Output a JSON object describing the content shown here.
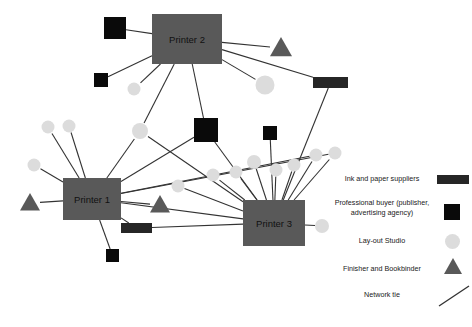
{
  "figure": {
    "type": "network-diagram",
    "title": "",
    "background_color": "#ffffff",
    "width": 472,
    "height": 327
  },
  "colors": {
    "printer_fill": "#595959",
    "printer_text": "#111111",
    "supplier_rect": "#262626",
    "buyer_square": "#0a0a0a",
    "layout_circle": "#dcdcdc",
    "finisher_triangle": "#595959",
    "tie_line": "#333333"
  },
  "legend": {
    "items": [
      {
        "label": "Ink and paper suppliers",
        "icon": "rect-swatch-icon",
        "shape": "rect",
        "color": "#262626"
      },
      {
        "label": "Professional buyer\n(publisher, advertising\nagency)",
        "icon": "square-swatch-icon",
        "shape": "square",
        "color": "#0a0a0a"
      },
      {
        "label": "Lay-out Studio",
        "icon": "circle-swatch-icon",
        "shape": "circle",
        "color": "#dcdcdc"
      },
      {
        "label": "Finisher and Bookbinder",
        "icon": "triangle-swatch-icon",
        "shape": "triangle",
        "color": "#595959"
      },
      {
        "label": "Network tie",
        "icon": "line-swatch-icon",
        "shape": "line",
        "color": "#333333"
      }
    ]
  },
  "nodes": {
    "printers": [
      {
        "id": "p1",
        "label": "Printer 1",
        "x": 63,
        "y": 178,
        "w": 58,
        "h": 42
      },
      {
        "id": "p2",
        "label": "Printer 2",
        "x": 152,
        "y": 14,
        "w": 70,
        "h": 50
      },
      {
        "id": "p3",
        "label": "Printer 3",
        "x": 243,
        "y": 200,
        "w": 62,
        "h": 46
      }
    ],
    "suppliers": [
      {
        "id": "s1",
        "x": 313,
        "y": 77,
        "w": 35,
        "h": 11
      },
      {
        "id": "s2",
        "x": 121,
        "y": 223,
        "w": 31,
        "h": 10
      }
    ],
    "buyers": [
      {
        "id": "b1",
        "x": 104,
        "y": 17,
        "s": 22
      },
      {
        "id": "b2",
        "x": 94,
        "y": 73,
        "s": 14
      },
      {
        "id": "b3",
        "x": 194,
        "y": 118,
        "s": 24
      },
      {
        "id": "b4",
        "x": 263,
        "y": 126,
        "s": 14
      },
      {
        "id": "b5",
        "x": 106,
        "y": 249,
        "s": 13
      }
    ],
    "studios": [
      {
        "id": "c1",
        "cx": 134,
        "cy": 89,
        "r": 6.5
      },
      {
        "id": "c2",
        "cx": 265,
        "cy": 85,
        "r": 9.5
      },
      {
        "id": "c3",
        "cx": 48,
        "cy": 127,
        "r": 6.5
      },
      {
        "id": "c4",
        "cx": 69,
        "cy": 126,
        "r": 6.5
      },
      {
        "id": "c5",
        "cx": 34,
        "cy": 165,
        "r": 6.5
      },
      {
        "id": "c6",
        "cx": 140,
        "cy": 131,
        "r": 8.0
      },
      {
        "id": "c7",
        "cx": 178,
        "cy": 186,
        "r": 6.5
      },
      {
        "id": "c8",
        "cx": 213,
        "cy": 175,
        "r": 6.5
      },
      {
        "id": "c9",
        "cx": 236,
        "cy": 172,
        "r": 6.5
      },
      {
        "id": "c10",
        "cx": 254,
        "cy": 162,
        "r": 7.0
      },
      {
        "id": "c11",
        "cx": 276,
        "cy": 170,
        "r": 6.5
      },
      {
        "id": "c12",
        "cx": 294,
        "cy": 165,
        "r": 6.5
      },
      {
        "id": "c13",
        "cx": 316,
        "cy": 155,
        "r": 6.5
      },
      {
        "id": "c14",
        "cx": 335,
        "cy": 153,
        "r": 6.5
      },
      {
        "id": "c15",
        "cx": 322,
        "cy": 226,
        "r": 7.0
      }
    ],
    "finishers": [
      {
        "id": "f1",
        "cx": 281,
        "cy": 48,
        "size": 11
      },
      {
        "id": "f2",
        "cx": 30,
        "cy": 203,
        "size": 10
      },
      {
        "id": "f3",
        "cx": 160,
        "cy": 205,
        "size": 10
      }
    ]
  },
  "edges": [
    {
      "from": "b1",
      "to": "p2"
    },
    {
      "from": "b2",
      "to": "p2"
    },
    {
      "from": "c1",
      "to": "p2"
    },
    {
      "from": "f1",
      "to": "p2"
    },
    {
      "from": "c2",
      "to": "p2"
    },
    {
      "from": "s1",
      "to": "p2"
    },
    {
      "from": "p2",
      "to": "b3"
    },
    {
      "from": "p2",
      "to": "c6"
    },
    {
      "from": "s1",
      "to": "p3"
    },
    {
      "from": "b4",
      "to": "p3"
    },
    {
      "from": "b3",
      "to": "p1"
    },
    {
      "from": "b3",
      "to": "p3"
    },
    {
      "from": "c6",
      "to": "p1"
    },
    {
      "from": "c6",
      "to": "p3"
    },
    {
      "from": "c3",
      "to": "p1"
    },
    {
      "from": "c4",
      "to": "p1"
    },
    {
      "from": "c5",
      "to": "p1"
    },
    {
      "from": "f2",
      "to": "p1"
    },
    {
      "from": "p1",
      "to": "s2"
    },
    {
      "from": "p1",
      "to": "b5"
    },
    {
      "from": "p1",
      "to": "f3"
    },
    {
      "from": "p1",
      "to": "p3"
    },
    {
      "from": "p1",
      "to": "c13"
    },
    {
      "from": "p1",
      "to": "c14"
    },
    {
      "from": "s2",
      "to": "p3"
    },
    {
      "from": "c7",
      "to": "p3"
    },
    {
      "from": "c8",
      "to": "p3"
    },
    {
      "from": "c9",
      "to": "p3"
    },
    {
      "from": "c10",
      "to": "p3"
    },
    {
      "from": "c11",
      "to": "p3"
    },
    {
      "from": "c12",
      "to": "p3"
    },
    {
      "from": "c13",
      "to": "p3"
    },
    {
      "from": "c14",
      "to": "p3"
    },
    {
      "from": "c15",
      "to": "p3"
    }
  ]
}
